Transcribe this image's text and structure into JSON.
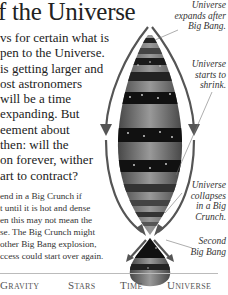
{
  "title": "f the Universe",
  "body_lines": [
    "vs for certain what is",
    "pen to the Universe.",
    "is getting larger and",
    "ost astronomers",
    "will be a time",
    "expanding. But",
    "eement about",
    "then: will the",
    "on forever, wither",
    "art to contract?"
  ],
  "small_lines": [
    "end in a Big Crunch if",
    "t until it is hot and dense",
    "en this may not mean the",
    "se. The Big Crunch might",
    "other Big Bang explosion,",
    "ccess could start over again."
  ],
  "captions": {
    "expands": [
      "Universe",
      "expands after",
      "Big Bang."
    ],
    "shrink": [
      "Universe",
      "starts to",
      "shrink."
    ],
    "collapses": [
      "Universe",
      "collapses",
      "in a Big",
      "Crunch."
    ],
    "second": [
      "Second",
      "Big Bang"
    ]
  },
  "footer": {
    "items": [
      "Gravity",
      "Stars",
      "Time",
      "Universe"
    ]
  },
  "colors": {
    "text": "#222222",
    "rule": "#bbbbbb",
    "footer_text": "#555555"
  }
}
